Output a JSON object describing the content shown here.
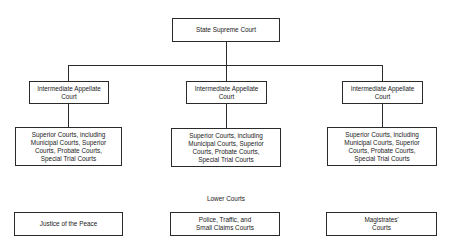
{
  "top": {
    "label": "State Supreme Court"
  },
  "branches": [
    {
      "appellate": "Intermediate Appellate\nCourt",
      "trial": "Superior Courts, including\nMunicipal Courts, Superior\nCourts, Probate Courts,\nSpecial Trial Courts"
    },
    {
      "appellate": "Intermediate Appellate\nCourt",
      "trial": "Superior Courts, including\nMunicipal Courts, Superior\nCourts, Probate Courts,\nSpecial Trial Courts"
    },
    {
      "appellate": "Intermediate Appellate\nCourt",
      "trial": "Superior Courts, including\nMunicipal Courts, Superior\nCourts, Probate Courts,\nSpecial Trial Courts"
    }
  ],
  "lower": {
    "heading": "Lower Courts",
    "items": [
      {
        "label": "Justice of the Peace"
      },
      {
        "label": "Police, Traffic, and\nSmall Claims Courts"
      },
      {
        "label": "Magistrates'\nCourts"
      }
    ]
  },
  "colors": {
    "line": "#2a2a2a",
    "background": "#ffffff"
  }
}
